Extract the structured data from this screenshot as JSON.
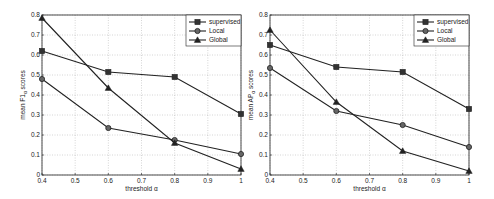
{
  "chart_data": [
    {
      "type": "line",
      "title": "",
      "xlabel": "threshold α",
      "ylabel": "mean F1α scores",
      "ylabel_main": "mean F1",
      "ylabel_sub": "α",
      "ylabel_tail": " scores",
      "x": [
        0.4,
        0.6,
        0.8,
        1.0
      ],
      "xlim": [
        0.4,
        1.0
      ],
      "ylim": [
        0,
        0.8
      ],
      "xticks": [
        "0.4",
        "0.5",
        "0.6",
        "0.7",
        "0.8",
        "0.9",
        "1"
      ],
      "yticks": [
        "0",
        "0.1",
        "0.2",
        "0.3",
        "0.4",
        "0.5",
        "0.6",
        "0.7",
        "0.8"
      ],
      "grid": true,
      "legend_position": "upper right",
      "series": [
        {
          "name": "supervised",
          "marker": "square",
          "values": [
            0.62,
            0.515,
            0.49,
            0.305
          ]
        },
        {
          "name": "Local",
          "marker": "circle",
          "values": [
            0.48,
            0.235,
            0.175,
            0.105
          ]
        },
        {
          "name": "Global",
          "marker": "triangle",
          "values": [
            0.785,
            0.435,
            0.16,
            0.03
          ]
        }
      ]
    },
    {
      "type": "line",
      "title": "",
      "xlabel": "threshold α",
      "ylabel": "mean APα scores",
      "ylabel_main": "mean AP",
      "ylabel_sub": "α",
      "ylabel_tail": " scores",
      "x": [
        0.4,
        0.6,
        0.8,
        1.0
      ],
      "xlim": [
        0.4,
        1.0
      ],
      "ylim": [
        0,
        0.8
      ],
      "xticks": [
        "0.4",
        "0.5",
        "0.6",
        "0.7",
        "0.8",
        "0.9",
        "1"
      ],
      "yticks": [
        "0",
        "0.1",
        "0.2",
        "0.3",
        "0.4",
        "0.5",
        "0.6",
        "0.7",
        "0.8"
      ],
      "grid": true,
      "legend_position": "upper right",
      "series": [
        {
          "name": "supervised",
          "marker": "square",
          "values": [
            0.65,
            0.54,
            0.515,
            0.33
          ]
        },
        {
          "name": "Local",
          "marker": "circle",
          "values": [
            0.535,
            0.32,
            0.25,
            0.14
          ]
        },
        {
          "name": "Global",
          "marker": "triangle",
          "values": [
            0.725,
            0.365,
            0.12,
            0.02
          ]
        }
      ]
    }
  ]
}
